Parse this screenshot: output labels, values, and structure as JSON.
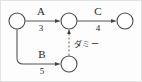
{
  "diagram": {
    "type": "arrow-diagram",
    "title": "",
    "background_color": "#fdfdfd",
    "line_color": "#555555",
    "node_stroke_color": "#4a4a4a",
    "text_color": "#262626",
    "nodes": [
      {
        "id": "n1",
        "label": "",
        "cx": 17,
        "cy": 21,
        "r": 8
      },
      {
        "id": "n2",
        "label": "",
        "cx": 69,
        "cy": 21,
        "r": 8
      },
      {
        "id": "n3",
        "label": "",
        "cx": 125,
        "cy": 21,
        "r": 8
      },
      {
        "id": "n4",
        "label": "",
        "cx": 69,
        "cy": 64,
        "r": 8
      }
    ],
    "edges": [
      {
        "id": "eA",
        "name": "A",
        "duration": "3",
        "from": "n1",
        "to": "n2",
        "style": "solid"
      },
      {
        "id": "eC",
        "name": "C",
        "duration": "4",
        "from": "n2",
        "to": "n3",
        "style": "solid"
      },
      {
        "id": "eB",
        "name": "B",
        "duration": "5",
        "from": "n1",
        "to": "n4",
        "style": "solid"
      },
      {
        "id": "eDummy",
        "name": "ダミー",
        "duration": "",
        "from": "n4",
        "to": "n2",
        "style": "dashed"
      }
    ],
    "labels": {
      "edge_a_name": "A",
      "edge_a_duration": "3",
      "edge_c_name": "C",
      "edge_c_duration": "4",
      "edge_b_name": "B",
      "edge_b_duration": "5",
      "dummy_label": "ダミー"
    }
  }
}
